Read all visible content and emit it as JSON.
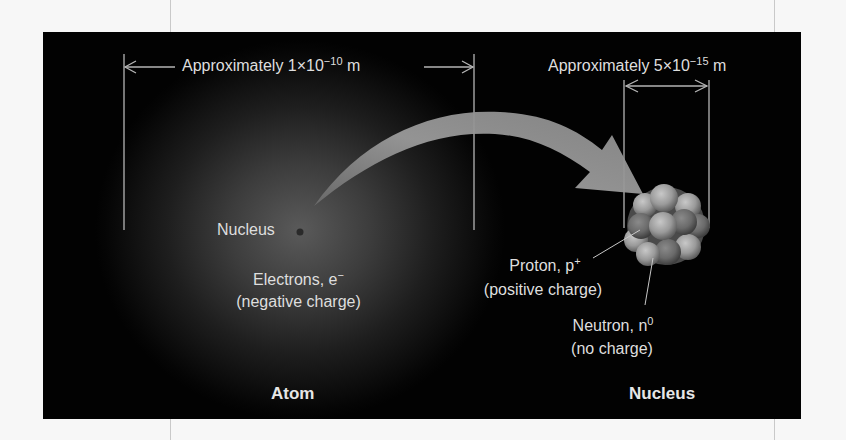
{
  "figure": {
    "title_implied": "Atom and Nucleus",
    "colors": {
      "background": "#020202",
      "text": "#dedede",
      "arrow": "#8f8f8f",
      "glow_center": "#5a5a5a",
      "lines": "#b5b5b5"
    },
    "scales": {
      "atom": {
        "prefix": "Approximately 1",
        "times": "×",
        "base": "10",
        "exponent": "−10",
        "unit": "m"
      },
      "nucleus": {
        "prefix": "Approximately 5",
        "times": "×",
        "base": "10",
        "exponent": "−15",
        "unit": "m"
      }
    },
    "atom": {
      "nucleus_label": "Nucleus",
      "electrons_label": "Electrons, e",
      "electrons_superscript": "−",
      "electrons_charge": "(negative charge)",
      "caption": "Atom"
    },
    "nucleus": {
      "proton_label": "Proton, p",
      "proton_superscript": "+",
      "proton_charge": "(positive charge)",
      "neutron_label": "Neutron, n",
      "neutron_superscript": "0",
      "neutron_charge": "(no charge)",
      "caption": "Nucleus"
    }
  }
}
